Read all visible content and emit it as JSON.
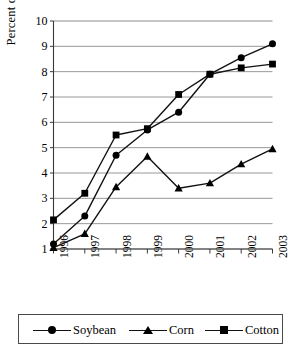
{
  "chart_data": {
    "type": "line",
    "title": "",
    "xlabel": "",
    "ylabel": "Percent of Planted Area",
    "categories": [
      "1996",
      "1997",
      "1998",
      "1999",
      "2000",
      "2001",
      "2002",
      "2003"
    ],
    "ylim": [
      1,
      10
    ],
    "yticks": [
      1,
      2,
      3,
      4,
      5,
      6,
      7,
      8,
      9,
      10
    ],
    "grid": "horizontal",
    "legend_position": "bottom",
    "series": [
      {
        "name": "Soybean",
        "marker": "circle",
        "values": [
          1.2,
          2.3,
          4.7,
          5.7,
          6.4,
          7.9,
          8.55,
          9.1
        ]
      },
      {
        "name": "Corn",
        "marker": "triangle",
        "values": [
          1.05,
          1.6,
          3.45,
          4.65,
          3.4,
          3.6,
          4.35,
          4.95
        ]
      },
      {
        "name": "Cotton",
        "marker": "square",
        "values": [
          2.15,
          3.2,
          5.5,
          5.75,
          7.1,
          7.9,
          8.15,
          8.3
        ]
      }
    ]
  },
  "colors": {
    "line": "#111111",
    "marker": "#000000",
    "grid": "#8c8c8c",
    "axis": "#3a3a3a",
    "legend_border": "#4a4a4a"
  }
}
